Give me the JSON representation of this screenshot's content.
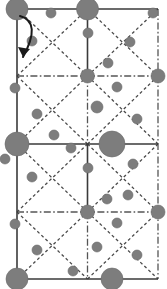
{
  "figure": {
    "width": 167,
    "height": 289,
    "background_color": "#ffffff"
  },
  "colors": {
    "atom_fill": "#7d7d7d",
    "atom_stroke": "#6a6a6a",
    "solid_line": "#3a3a3a",
    "dashed_line": "#4a4a4a",
    "dashdot_line": "#555555",
    "arrow": "#1a1a1a"
  },
  "geometry": {
    "cell_left": 17,
    "cell_right": 158,
    "cell_top": 9,
    "cell_bottom": 279,
    "mid_x": 87.5,
    "row_y": [
      9,
      76,
      144,
      212,
      279
    ],
    "cell_width": 70.5,
    "cell_height": 67.5
  },
  "lines": {
    "solid": [
      {
        "name": "border-top",
        "x1": 17,
        "y1": 9,
        "x2": 158,
        "y2": 9
      },
      {
        "name": "border-bottom",
        "x1": 17,
        "y1": 279,
        "x2": 158,
        "y2": 279
      },
      {
        "name": "border-left",
        "x1": 17,
        "y1": 9,
        "x2": 17,
        "y2": 279
      },
      {
        "name": "horizontal-mid",
        "x1": 17,
        "y1": 144,
        "x2": 158,
        "y2": 144
      },
      {
        "name": "vertical-mid-upper",
        "x1": 87.5,
        "y1": 9,
        "x2": 87.5,
        "y2": 76
      },
      {
        "name": "vertical-mid-lower",
        "x1": 87.5,
        "y1": 144,
        "x2": 87.5,
        "y2": 212
      }
    ],
    "dashdot": [
      {
        "name": "border-right",
        "x1": 158,
        "y1": 9,
        "x2": 158,
        "y2": 279
      },
      {
        "name": "horizontal-quarter-upper",
        "x1": 17,
        "y1": 76,
        "x2": 158,
        "y2": 76
      },
      {
        "name": "horizontal-quarter-lower",
        "x1": 17,
        "y1": 212,
        "x2": 158,
        "y2": 212
      },
      {
        "name": "vertical-center-a",
        "x1": 87.5,
        "y1": 76,
        "x2": 87.5,
        "y2": 144
      },
      {
        "name": "vertical-center-b",
        "x1": 87.5,
        "y1": 212,
        "x2": 87.5,
        "y2": 279
      }
    ],
    "dashed_diagonals": [
      {
        "name": "diag-r1c1-down",
        "x1": 17,
        "y1": 9,
        "x2": 87.5,
        "y2": 76
      },
      {
        "name": "diag-r1c1-up",
        "x1": 17,
        "y1": 76,
        "x2": 87.5,
        "y2": 9
      },
      {
        "name": "diag-r1c2-down",
        "x1": 87.5,
        "y1": 9,
        "x2": 158,
        "y2": 76
      },
      {
        "name": "diag-r1c2-up",
        "x1": 87.5,
        "y1": 76,
        "x2": 158,
        "y2": 9
      },
      {
        "name": "diag-r2c1-down",
        "x1": 17,
        "y1": 76,
        "x2": 87.5,
        "y2": 144
      },
      {
        "name": "diag-r2c1-up",
        "x1": 17,
        "y1": 144,
        "x2": 87.5,
        "y2": 76
      },
      {
        "name": "diag-r2c2-down",
        "x1": 87.5,
        "y1": 76,
        "x2": 158,
        "y2": 144
      },
      {
        "name": "diag-r2c2-up",
        "x1": 87.5,
        "y1": 144,
        "x2": 158,
        "y2": 76
      },
      {
        "name": "diag-r3c1-down",
        "x1": 17,
        "y1": 144,
        "x2": 87.5,
        "y2": 212
      },
      {
        "name": "diag-r3c1-up",
        "x1": 17,
        "y1": 212,
        "x2": 87.5,
        "y2": 144
      },
      {
        "name": "diag-r3c2-down",
        "x1": 87.5,
        "y1": 144,
        "x2": 158,
        "y2": 212
      },
      {
        "name": "diag-r3c2-up",
        "x1": 87.5,
        "y1": 212,
        "x2": 158,
        "y2": 144
      },
      {
        "name": "diag-r4c1-down",
        "x1": 17,
        "y1": 212,
        "x2": 87.5,
        "y2": 279
      },
      {
        "name": "diag-r4c1-up",
        "x1": 17,
        "y1": 279,
        "x2": 87.5,
        "y2": 212
      },
      {
        "name": "diag-r4c2-down",
        "x1": 87.5,
        "y1": 212,
        "x2": 158,
        "y2": 279
      },
      {
        "name": "diag-r4c2-up",
        "x1": 87.5,
        "y1": 279,
        "x2": 158,
        "y2": 212
      }
    ]
  },
  "atoms": {
    "large": [
      {
        "cx": 17,
        "cy": 9,
        "r": 11
      },
      {
        "cx": 87.5,
        "cy": 9,
        "r": 11
      },
      {
        "cx": 17,
        "cy": 144,
        "r": 12
      },
      {
        "cx": 112,
        "cy": 144,
        "r": 13
      },
      {
        "cx": 17,
        "cy": 279,
        "r": 11
      },
      {
        "cx": 112,
        "cy": 279,
        "r": 11
      }
    ],
    "medium": [
      {
        "cx": 87.5,
        "cy": 76,
        "r": 7
      },
      {
        "cx": 87.5,
        "cy": 212,
        "r": 7
      },
      {
        "cx": 158,
        "cy": 76,
        "r": 7
      },
      {
        "cx": 158,
        "cy": 212,
        "r": 7
      }
    ],
    "small": [
      {
        "cx": 51,
        "cy": 13,
        "r": 5
      },
      {
        "cx": 153,
        "cy": 13,
        "r": 5
      },
      {
        "cx": 88,
        "cy": 33,
        "r": 5
      },
      {
        "cx": 32,
        "cy": 41,
        "r": 5
      },
      {
        "cx": 130,
        "cy": 42,
        "r": 5
      },
      {
        "cx": 108,
        "cy": 63,
        "r": 5
      },
      {
        "cx": 15,
        "cy": 88,
        "r": 5
      },
      {
        "cx": 117,
        "cy": 87,
        "r": 5
      },
      {
        "cx": 37,
        "cy": 114,
        "r": 5
      },
      {
        "cx": 97,
        "cy": 107,
        "r": 6
      },
      {
        "cx": 137,
        "cy": 119,
        "r": 5
      },
      {
        "cx": 54,
        "cy": 135,
        "r": 5
      },
      {
        "cx": 71,
        "cy": 148,
        "r": 5
      },
      {
        "cx": 5,
        "cy": 159,
        "r": 5
      },
      {
        "cx": 133,
        "cy": 164,
        "r": 5
      },
      {
        "cx": 88,
        "cy": 168,
        "r": 5
      },
      {
        "cx": 32,
        "cy": 177,
        "r": 5
      },
      {
        "cx": 128,
        "cy": 195,
        "r": 5
      },
      {
        "cx": 107,
        "cy": 199,
        "r": 5
      },
      {
        "cx": 15,
        "cy": 224,
        "r": 5
      },
      {
        "cx": 117,
        "cy": 223,
        "r": 5
      },
      {
        "cx": 37,
        "cy": 250,
        "r": 5
      },
      {
        "cx": 97,
        "cy": 247,
        "r": 5
      },
      {
        "cx": 137,
        "cy": 255,
        "r": 5
      },
      {
        "cx": 73,
        "cy": 271,
        "r": 5
      }
    ]
  },
  "arrow": {
    "name": "rotation-arrow",
    "path": "M 20 16 Q 42 22 23 57",
    "head": "M 23 57 L 18 47 L 30 49 Z"
  }
}
